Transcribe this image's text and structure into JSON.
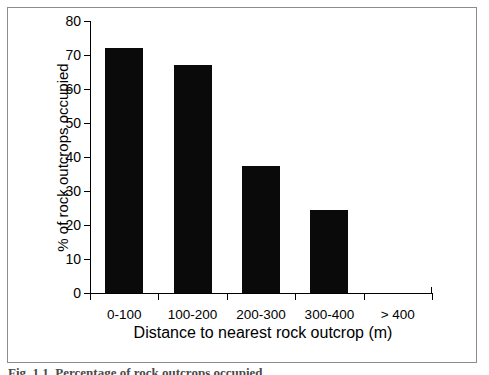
{
  "chart_data": {
    "type": "bar",
    "title": "",
    "subtitle": "",
    "categories": [
      "0-100",
      "100-200",
      "200-300",
      "300-400",
      "> 400"
    ],
    "values": [
      72,
      67,
      37.5,
      24.5,
      0
    ],
    "xlabel": "Distance to nearest rock outcrop (m)",
    "ylabel": "% of rock outcrops occupied",
    "ylim": [
      0,
      80
    ],
    "yticks": [
      0,
      10,
      20,
      30,
      40,
      50,
      60,
      70,
      80
    ],
    "ytick_labels": [
      "0",
      "10",
      "20",
      "30",
      "40",
      "50",
      "60",
      "70",
      "80"
    ],
    "grid": false,
    "legend": false,
    "legend_position": "none",
    "bar_color": "#0a0a0a",
    "axis_color": "#000000",
    "background_color": "#ffffff"
  },
  "figure": {
    "frame_color": "#8c8c8c",
    "caption": "Fig. 1.1.   Percentage of rock outcrops occupied"
  }
}
